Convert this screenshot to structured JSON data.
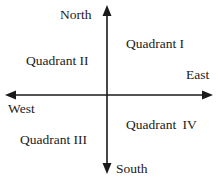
{
  "diagram": {
    "type": "compass-quadrants",
    "directions": {
      "north": "North",
      "south": "South",
      "east": "East",
      "west": "West"
    },
    "quadrants": {
      "q1": "Quadrant I",
      "q2": "Quadrant II",
      "q3": "Quadrant III",
      "q4": "Quadrant IV"
    },
    "colors": {
      "ink": "#1a1a1a",
      "background": "#ffffff"
    }
  }
}
